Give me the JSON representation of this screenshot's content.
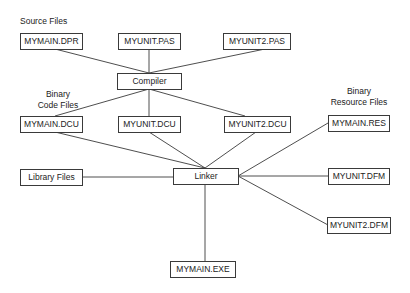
{
  "diagram": {
    "labels": {
      "source_files": "Source Files",
      "binary_code_files_line1": "Binary",
      "binary_code_files_line2": "Code Files",
      "binary_resource_files_line1": "Binary",
      "binary_resource_files_line2": "Resource Files"
    },
    "nodes": {
      "mymain_dpr": "MYMAIN.DPR",
      "myunit_pas": "MYUNIT.PAS",
      "myunit2_pas": "MYUNIT2.PAS",
      "compiler": "Compiler",
      "mymain_dcu": "MYMAIN.DCU",
      "myunit_dcu": "MYUNIT.DCU",
      "myunit2_dcu": "MYUNIT2.DCU",
      "library_files": "Library Files",
      "linker": "Linker",
      "mymain_res": "MYMAIN.RES",
      "myunit_dfm": "MYUNIT.DFM",
      "myunit2_dfm": "MYUNIT2.DFM",
      "mymain_exe": "MYMAIN.EXE"
    },
    "edges": [
      [
        "MYMAIN.DPR",
        "Compiler"
      ],
      [
        "MYUNIT.PAS",
        "Compiler"
      ],
      [
        "MYUNIT2.PAS",
        "Compiler"
      ],
      [
        "Compiler",
        "MYMAIN.DCU"
      ],
      [
        "Compiler",
        "MYUNIT.DCU"
      ],
      [
        "Compiler",
        "MYUNIT2.DCU"
      ],
      [
        "MYMAIN.DCU",
        "Linker"
      ],
      [
        "MYUNIT.DCU",
        "Linker"
      ],
      [
        "MYUNIT2.DCU",
        "Linker"
      ],
      [
        "Library Files",
        "Linker"
      ],
      [
        "MYMAIN.RES",
        "Linker"
      ],
      [
        "MYUNIT.DFM",
        "Linker"
      ],
      [
        "MYUNIT2.DFM",
        "Linker"
      ],
      [
        "Linker",
        "MYMAIN.EXE"
      ]
    ],
    "colors": {
      "line": "#3a3a3a",
      "text": "#222222",
      "background": "#ffffff"
    }
  }
}
